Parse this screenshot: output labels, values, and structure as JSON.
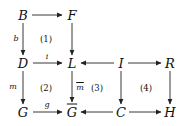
{
  "diagram": {
    "type": "commutative-diagram",
    "nodes": {
      "B": "B",
      "F": "F",
      "D": "D",
      "L": "L",
      "I": "I",
      "R": "R",
      "G": "G",
      "Gbar": "G",
      "C": "C",
      "H": "H"
    },
    "arrow_labels": {
      "b": "b",
      "i": "i",
      "m": "m",
      "mbar": "m",
      "g": "g"
    },
    "regions": {
      "r1": "(1)",
      "r2": "(2)",
      "r3": "(3)",
      "r4": "(4)"
    },
    "edges": [
      {
        "from": "B",
        "to": "F",
        "label": ""
      },
      {
        "from": "B",
        "to": "D",
        "label": "b"
      },
      {
        "from": "F",
        "to": "L",
        "label": ""
      },
      {
        "from": "D",
        "to": "L",
        "label": "i"
      },
      {
        "from": "I",
        "to": "L",
        "label": ""
      },
      {
        "from": "I",
        "to": "R",
        "label": ""
      },
      {
        "from": "D",
        "to": "G",
        "label": "m"
      },
      {
        "from": "L",
        "to": "Gbar",
        "label": "m̄"
      },
      {
        "from": "I",
        "to": "C",
        "label": ""
      },
      {
        "from": "R",
        "to": "H",
        "label": ""
      },
      {
        "from": "G",
        "to": "Gbar",
        "label": "g"
      },
      {
        "from": "C",
        "to": "Gbar",
        "label": ""
      },
      {
        "from": "C",
        "to": "H",
        "label": ""
      }
    ]
  }
}
